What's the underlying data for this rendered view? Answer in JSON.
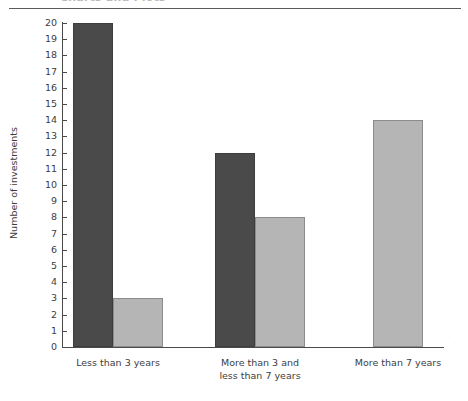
{
  "page": {
    "header_cut_text": "Charts and Plots",
    "header_rule": "horizontal-rule"
  },
  "chart_data": {
    "type": "bar",
    "title": "",
    "subtitle": "",
    "xlabel": "",
    "ylabel": "Number of investments",
    "categories": [
      "Less than 3 years",
      "More than 3 and\nless than 7 years",
      "More than 7 years"
    ],
    "category_lines": [
      [
        "Less than 3 years"
      ],
      [
        "More than 3 and",
        "less than 7 years"
      ],
      [
        "More than 7 years"
      ]
    ],
    "series": [
      {
        "name": "Series 1",
        "color": "#4a4a4a",
        "values": [
          20,
          12,
          null
        ]
      },
      {
        "name": "Series 2",
        "color": "#b5b5b5",
        "values": [
          3,
          8,
          14
        ]
      }
    ],
    "ylim": [
      0,
      20
    ],
    "ytick_step": 1,
    "ytick_labels": [
      "0",
      "1",
      "2",
      "3",
      "4",
      "5",
      "6",
      "7",
      "8",
      "9",
      "10",
      "11",
      "12",
      "13",
      "14",
      "15",
      "16",
      "17",
      "18",
      "19",
      "20"
    ],
    "grid": false,
    "legend": null,
    "legend_position": "none",
    "annotations": []
  },
  "colors": {
    "series_dark": "#4a4a4a",
    "series_light": "#b5b5b5",
    "axis": "#4a4a4a",
    "text": "#3d3d3d",
    "background": "#ffffff"
  },
  "geometry": {
    "plot_left": 63,
    "plot_right": 444,
    "plot_top": 23,
    "plot_bottom": 347,
    "bar_width": 40,
    "bar_width_light": 50,
    "group_dark_x": [
      73,
      215,
      null
    ],
    "group_light_x": [
      113,
      255,
      373
    ]
  }
}
